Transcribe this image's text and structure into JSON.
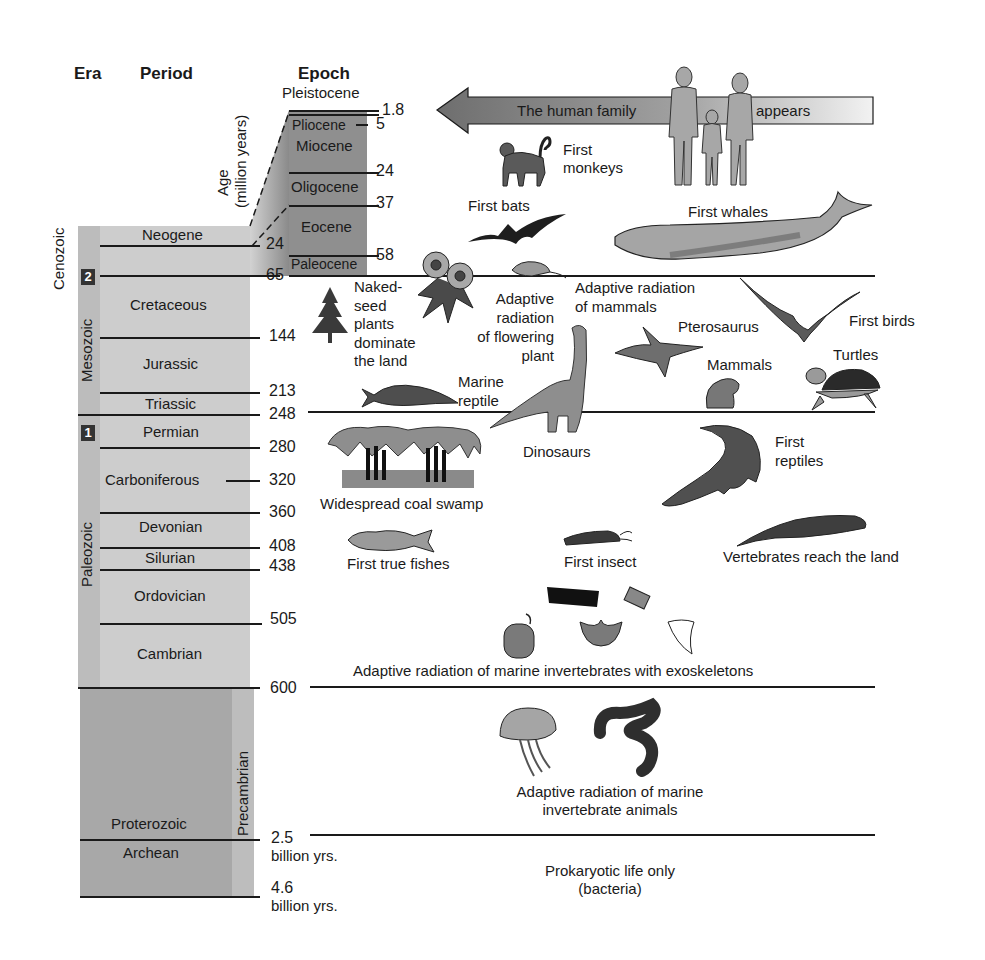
{
  "headers": {
    "era": "Era",
    "period": "Period",
    "epoch": "Epoch",
    "age_axis": "Age",
    "age_unit": "(million years)"
  },
  "eras": [
    {
      "name": "Cenozoic",
      "badge": "2"
    },
    {
      "name": "Mesozoic"
    },
    {
      "name": "Paleozoic",
      "badge": "1"
    },
    {
      "name": "Precambrian"
    }
  ],
  "periods": [
    "Neogene",
    "Cretaceous",
    "Jurassic",
    "Triassic",
    "Permian",
    "Carboniferous",
    "Devonian",
    "Silurian",
    "Ordovician",
    "Cambrian",
    "Proterozoic",
    "Archean"
  ],
  "epochs": [
    "Pleistocene",
    "Pliocene",
    "Miocene",
    "Oligocene",
    "Eocene",
    "Paleocene"
  ],
  "epoch_ages": [
    "1.8",
    "5",
    "24",
    "37",
    "58"
  ],
  "ages": [
    "24",
    "65",
    "144",
    "213",
    "248",
    "280",
    "320",
    "360",
    "408",
    "438",
    "505",
    "600",
    "2.5",
    "billion yrs.",
    "4.6",
    "billion yrs."
  ],
  "arrow": {
    "left_text": "The human family",
    "right_text": "appears"
  },
  "events": {
    "first_monkeys": [
      "First",
      "monkeys"
    ],
    "first_bats": "First bats",
    "first_whales": "First whales",
    "naked_seed": [
      "Naked-",
      "seed",
      "plants",
      "dominate",
      "the land"
    ],
    "flowering": [
      "Adaptive",
      "radiation",
      "of flowering",
      "plant"
    ],
    "mammal_radiation": [
      "Adaptive radiation",
      "of mammals"
    ],
    "pterosaurus": "Pterosaurus",
    "first_birds": "First birds",
    "mammals": "Mammals",
    "turtles": "Turtles",
    "marine_reptile": [
      "Marine",
      "reptile"
    ],
    "dinosaurs": "Dinosaurs",
    "coal_swamp": "Widespread coal swamp",
    "first_reptiles": [
      "First",
      "reptiles"
    ],
    "first_fishes": "First true fishes",
    "first_insect": "First insect",
    "vertebrates_land": "Vertebrates reach the land",
    "marine_exo": "Adaptive radiation of marine invertebrates with exoskeletons",
    "marine_inv": [
      "Adaptive radiation of marine",
      "invertebrate animals"
    ],
    "prokaryotic": [
      "Prokaryotic life only",
      "(bacteria)"
    ]
  },
  "colors": {
    "column_light": "#c9c9c9",
    "column_mid": "#b0b0b0",
    "epoch_dark": "#8f8f8f",
    "precambrian": "#a9a9a9",
    "ink": "#1a1a1a"
  }
}
